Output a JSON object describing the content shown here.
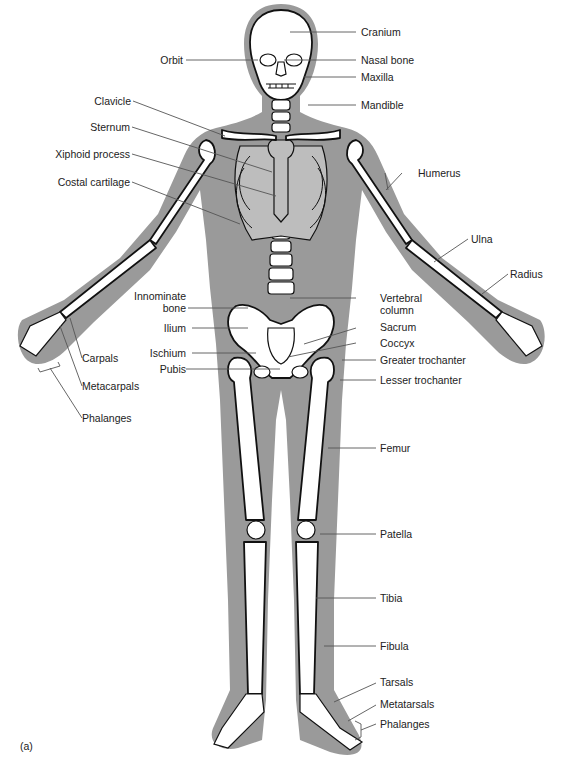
{
  "figure": {
    "panel_label": "(a)",
    "colors": {
      "body_silhouette": "#9a9a9a",
      "bone_fill": "#ffffff",
      "bone_outline": "#111111",
      "cartilage": "#bdbdbd",
      "leader_line": "#555555"
    }
  },
  "labels": {
    "right_side": [
      {
        "id": "cranium",
        "text": "Cranium"
      },
      {
        "id": "nasal_bone",
        "text": "Nasal bone"
      },
      {
        "id": "maxilla",
        "text": "Maxilla"
      },
      {
        "id": "mandible",
        "text": "Mandible"
      },
      {
        "id": "humerus",
        "text": "Humerus"
      },
      {
        "id": "ulna",
        "text": "Ulna"
      },
      {
        "id": "radius",
        "text": "Radius"
      },
      {
        "id": "vertebral_column",
        "text": "Vertebral",
        "text2": "column"
      },
      {
        "id": "sacrum",
        "text": "Sacrum"
      },
      {
        "id": "coccyx",
        "text": "Coccyx"
      },
      {
        "id": "greater_trochanter",
        "text": "Greater trochanter"
      },
      {
        "id": "lesser_trochanter",
        "text": "Lesser trochanter"
      },
      {
        "id": "femur",
        "text": "Femur"
      },
      {
        "id": "patella",
        "text": "Patella"
      },
      {
        "id": "tibia",
        "text": "Tibia"
      },
      {
        "id": "fibula",
        "text": "Fibula"
      },
      {
        "id": "tarsals",
        "text": "Tarsals"
      },
      {
        "id": "metatarsals",
        "text": "Metatarsals"
      },
      {
        "id": "phalanges_foot",
        "text": "Phalanges"
      }
    ],
    "left_side": [
      {
        "id": "orbit",
        "text": "Orbit"
      },
      {
        "id": "clavicle",
        "text": "Clavicle"
      },
      {
        "id": "sternum",
        "text": "Sternum"
      },
      {
        "id": "xiphoid_process",
        "text": "Xiphoid process"
      },
      {
        "id": "costal_cartilage",
        "text": "Costal cartilage"
      },
      {
        "id": "innominate_bone",
        "text": "Innominate",
        "text2": "bone"
      },
      {
        "id": "ilium",
        "text": "Ilium"
      },
      {
        "id": "ischium",
        "text": "Ischium"
      },
      {
        "id": "pubis",
        "text": "Pubis"
      },
      {
        "id": "carpals",
        "text": "Carpals"
      },
      {
        "id": "metacarpals",
        "text": "Metacarpals"
      },
      {
        "id": "phalanges_hand",
        "text": "Phalanges"
      }
    ]
  }
}
